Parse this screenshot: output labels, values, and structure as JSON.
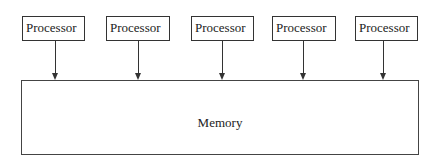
{
  "diagram": {
    "processors": [
      {
        "label": "Processor"
      },
      {
        "label": "Processor"
      },
      {
        "label": "Processor"
      },
      {
        "label": "Processor"
      },
      {
        "label": "Processor"
      }
    ],
    "memory": {
      "label": "Memory"
    },
    "colors": {
      "line": "#333333",
      "background": "#ffffff",
      "text": "#222222"
    }
  }
}
